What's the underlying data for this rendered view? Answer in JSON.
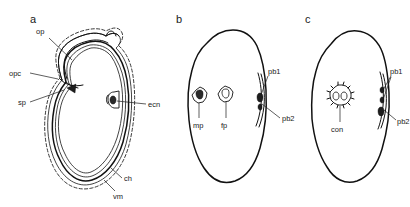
{
  "figure": {
    "type": "scientific-line-diagram",
    "background_color": "#ffffff",
    "ink_color": "#111111",
    "panel_count": 3
  },
  "panels": [
    {
      "id": "a",
      "letter": "a",
      "description": "Longitudinal section of egg showing shell layers, operculum and opercular cap",
      "labels": [
        {
          "key": "op",
          "text": "op",
          "meaning": "operculum"
        },
        {
          "key": "opc",
          "text": "opc",
          "meaning": "opercular collar"
        },
        {
          "key": "sp",
          "text": "sp",
          "meaning": "sperm entry point"
        },
        {
          "key": "ecn",
          "text": "ecn",
          "meaning": "egg cell nucleus notch"
        },
        {
          "key": "ch",
          "text": "ch",
          "meaning": "chorion"
        },
        {
          "key": "vm",
          "text": "vm",
          "meaning": "vitelline membrane"
        }
      ]
    },
    {
      "id": "b",
      "letter": "b",
      "description": "Egg with male pronucleus, female pronucleus and two polar bodies",
      "labels": [
        {
          "key": "mp",
          "text": "mp",
          "meaning": "male pronucleus"
        },
        {
          "key": "fp",
          "text": "fp",
          "meaning": "female pronucleus"
        },
        {
          "key": "pb1",
          "text": "pb1",
          "meaning": "first polar body"
        },
        {
          "key": "pb2",
          "text": "pb2",
          "meaning": "second polar body"
        }
      ]
    },
    {
      "id": "c",
      "letter": "c",
      "description": "Egg with fused conjugate nucleus and two polar bodies",
      "labels": [
        {
          "key": "con",
          "text": "con",
          "meaning": "conjugation / fused pronuclei"
        },
        {
          "key": "pb1",
          "text": "pb1",
          "meaning": "first polar body"
        },
        {
          "key": "pb2",
          "text": "pb2",
          "meaning": "second polar body"
        }
      ]
    }
  ],
  "labels": {
    "a_letter": "a",
    "b_letter": "b",
    "c_letter": "c",
    "a_op": "op",
    "a_opc": "opc",
    "a_sp": "sp",
    "a_ecn": "ecn",
    "a_ch": "ch",
    "a_vm": "vm",
    "b_mp": "mp",
    "b_fp": "fp",
    "b_pb1": "pb1",
    "b_pb2": "pb2",
    "c_con": "con",
    "c_pb1": "pb1",
    "c_pb2": "pb2"
  }
}
